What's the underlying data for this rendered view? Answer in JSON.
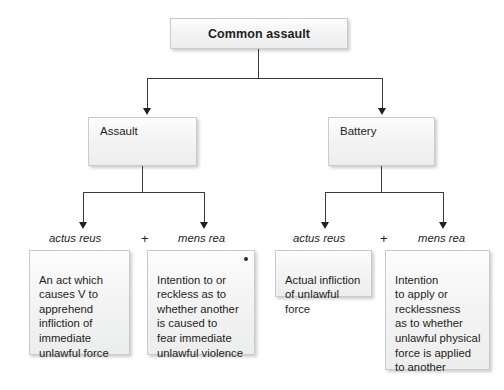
{
  "diagram": {
    "title": "Common assault",
    "root": {
      "label": "Common assault"
    },
    "level2": [
      {
        "label": "Assault"
      },
      {
        "label": "Battery"
      }
    ],
    "element_tags": {
      "actus_reus": "actus reus",
      "mens_rea": "mens rea",
      "plus": "+"
    },
    "branches": [
      {
        "parent": "Assault",
        "tags": [
          "actus reus",
          "mens rea"
        ],
        "leaves": [
          "An act which\ncauses V to\napprehend\ninfliction of\nimmediate\nunlawful force",
          "Intention to or\nreckless as to\nwhether another\nis caused to\nfear immediate\nunlawful violence"
        ]
      },
      {
        "parent": "Battery",
        "tags": [
          "actus reus",
          "mens rea"
        ],
        "leaves": [
          "Actual infliction\nof unlawful force",
          "Intention\nto apply or\nrecklessness\nas to whether\nunlawful physical\nforce is applied\nto another"
        ]
      }
    ],
    "colors": {
      "box_fill_top": "#fdfdfd",
      "box_fill_bottom": "#eceded",
      "box_border": "#c9cbcc",
      "connector": "#3a3a3a",
      "text": "#231f20",
      "background": "#ffffff"
    }
  }
}
